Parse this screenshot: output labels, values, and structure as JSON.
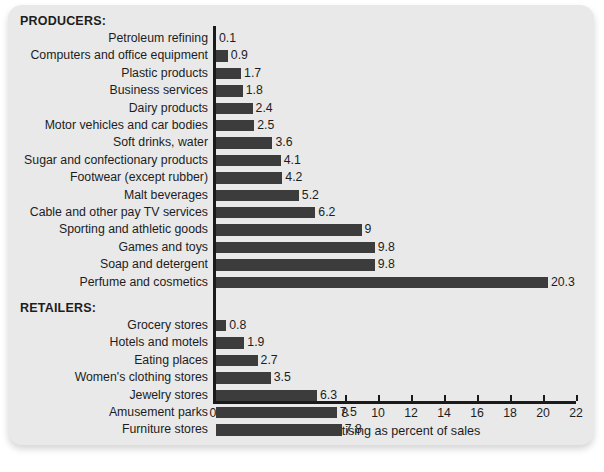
{
  "chart_data": {
    "type": "bar",
    "orientation": "horizontal",
    "title": "",
    "xlabel": "Advertising as percent of sales",
    "ylabel": "",
    "xlim": [
      0,
      22
    ],
    "xticks": [
      0,
      2,
      4,
      6,
      8,
      10,
      12,
      14,
      16,
      18,
      20,
      22
    ],
    "grid": false,
    "legend": null,
    "value_labels": true,
    "bar_color": "#3c3c3c",
    "background_color": "#e9e9e9",
    "text_color": "#1d1d1d",
    "groups": [
      {
        "header": "PRODUCERS:",
        "categories": [
          "Petroleum refining",
          "Computers and office equipment",
          "Plastic products",
          "Business services",
          "Dairy products",
          "Motor vehicles and car bodies",
          "Soft drinks, water",
          "Sugar and confectionary products",
          "Footwear (except rubber)",
          "Malt beverages",
          "Cable and other pay TV services",
          "Sporting and athletic goods",
          "Games and toys",
          "Soap and detergent",
          "Perfume and cosmetics"
        ],
        "values": [
          0.1,
          0.9,
          1.7,
          1.8,
          2.4,
          2.5,
          3.6,
          4.1,
          4.2,
          5.2,
          6.2,
          9,
          9.8,
          9.8,
          20.3
        ],
        "value_labels": [
          "0.1",
          "0.9",
          "1.7",
          "1.8",
          "2.4",
          "2.5",
          "3.6",
          "4.1",
          "4.2",
          "5.2",
          "6.2",
          "9",
          "9.8",
          "9.8",
          "20.3"
        ]
      },
      {
        "header": "RETAILERS:",
        "categories": [
          "Grocery stores",
          "Hotels and motels",
          "Eating places",
          "Women's clothing stores",
          "Jewelry stores",
          "Amusement parks",
          "Furniture stores"
        ],
        "values": [
          0.8,
          1.9,
          2.7,
          3.5,
          6.3,
          7.5,
          7.8
        ],
        "value_labels": [
          "0.8",
          "1.9",
          "2.7",
          "3.5",
          "6.3",
          "7.5",
          "7.8"
        ]
      }
    ]
  }
}
